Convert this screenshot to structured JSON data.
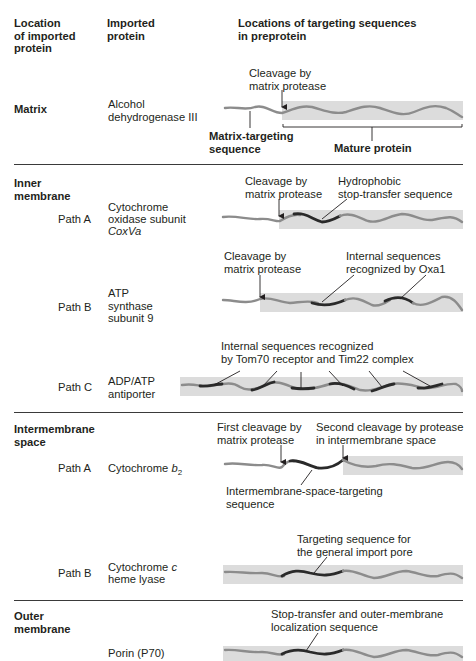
{
  "headers": {
    "location": "Location\nof imported\nprotein",
    "protein": "Imported\nprotein",
    "targeting": "Locations of targeting sequences\nin preprotein"
  },
  "sections": {
    "matrix": {
      "label": "Matrix",
      "protein": "Alcohol\ndehydrogenase III",
      "labels": {
        "cleavage": "Cleavage by\nmatrix protease",
        "targeting_seq": "Matrix-targeting\nsequence",
        "mature": "Mature protein"
      }
    },
    "inner_membrane": {
      "label": "Inner\nmembrane",
      "path_a": {
        "path": "Path A",
        "protein_line1": "Cytochrome",
        "protein_line2": "oxidase subunit",
        "protein_line3": "CoxVa",
        "cleavage": "Cleavage by\nmatrix protease",
        "stop_transfer": "Hydrophobic\nstop-transfer sequence"
      },
      "path_b": {
        "path": "Path B",
        "protein": "ATP\nsynthase\nsubunit 9",
        "cleavage": "Cleavage by\nmatrix protease",
        "internal": "Internal sequences\nrecognized by Oxa1"
      },
      "path_c": {
        "path": "Path C",
        "protein": "ADP/ATP\nantiporter",
        "internal": "Internal sequences recognized\nby Tom70 receptor and Tim22 complex"
      }
    },
    "intermembrane_space": {
      "label": "Intermembrane\nspace",
      "path_a": {
        "path": "Path A",
        "protein": "Cytochrome ",
        "protein_italic": "b",
        "protein_sub": "2",
        "first_cleavage": "First cleavage by\nmatrix protease",
        "second_cleavage": "Second cleavage by protease\nin intermembrane space",
        "ims_seq": "Intermembrane-space-targeting\nsequence"
      },
      "path_b": {
        "path": "Path B",
        "protein_pre": "Cytochrome ",
        "protein_italic": "c",
        "protein_line2": "heme lyase",
        "targeting": "Targeting sequence for\nthe general import pore"
      }
    },
    "outer_membrane": {
      "label": "Outer\nmembrane",
      "protein": "Porin (P70)",
      "stop_transfer": "Stop-transfer and outer-membrane\nlocalization sequence"
    }
  },
  "colors": {
    "band": "#dcdcdc",
    "chain_light": "#8c8c8c",
    "chain_dark": "#2a2a2a",
    "rule": "#3a3a3a"
  }
}
